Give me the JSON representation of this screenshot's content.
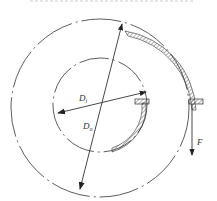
{
  "diagram": {
    "type": "brake drum / band brake schematic",
    "labels": {
      "inner_diameter": "D",
      "inner_diameter_sub": "i",
      "outer_diameter": "D",
      "outer_diameter_sub": "o",
      "force": "F"
    },
    "colors": {
      "line": "#333333",
      "background": "#ffffff"
    }
  }
}
